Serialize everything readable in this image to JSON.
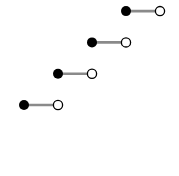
{
  "chart_data": {
    "type": "scatter",
    "subtype": "step-function",
    "title": "",
    "xlabel": "",
    "ylabel": "",
    "grid": false,
    "axes_visible": false,
    "legend": [],
    "colors": {
      "segment": "#8a8a8a",
      "closed_dot": "#000000",
      "open_dot_fill": "#ffffff",
      "open_dot_stroke": "#000000"
    },
    "steps": [
      {
        "x_start": 0,
        "x_end": 1,
        "y": 0,
        "start": "closed",
        "end": "open"
      },
      {
        "x_start": 1,
        "x_end": 2,
        "y": 1,
        "start": "closed",
        "end": "open"
      },
      {
        "x_start": 2,
        "x_end": 3,
        "y": 2,
        "start": "closed",
        "end": "open"
      },
      {
        "x_start": 3,
        "x_end": 4,
        "y": 3,
        "start": "closed",
        "end": "open"
      }
    ],
    "pixel_layout": {
      "origin_px": [
        24,
        105
      ],
      "x_unit_px": 34,
      "y_unit_px": 31.3,
      "dot_radius": 5,
      "segment_width": 2.6
    }
  }
}
